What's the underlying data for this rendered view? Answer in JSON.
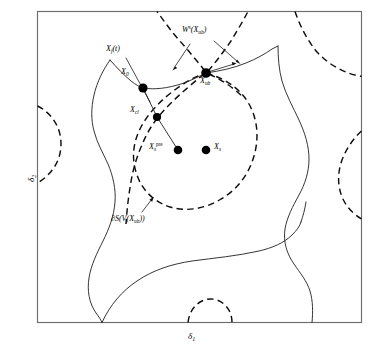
{
  "figure": {
    "kind": "phase-portrait-diagram",
    "caption_present": false,
    "background_color": "#ffffff",
    "frame_color": "#6d6d6d",
    "solid_curve_color": "#2b2b2b",
    "dashed_curve_color": "#0f0f0f",
    "node_color": "#000000"
  },
  "axes": {
    "x_label": "δ₁",
    "x_label_base": "δ",
    "x_label_sub": "1",
    "y_label": "δ₂",
    "y_label_base": "δ",
    "y_label_sub": "2"
  },
  "nodes": [
    {
      "id": "x0",
      "base": "X",
      "sub": "0",
      "sup": "",
      "label": "X₀",
      "x": 143,
      "y": 88,
      "r": 4.6,
      "label_x": 123,
      "label_y": 74
    },
    {
      "id": "xcl",
      "base": "X",
      "sub": "cl",
      "sup": "",
      "label": "Xₑₗ",
      "x": 157,
      "y": 117,
      "r": 4.1,
      "label_x": 132,
      "label_y": 110
    },
    {
      "id": "xspre",
      "base": "X",
      "sub": "s",
      "sup": "pre",
      "label": "Xₛᵖᵣᵉ",
      "x": 178,
      "y": 150,
      "r": 4.3,
      "label_x": 150,
      "label_y": 147
    },
    {
      "id": "xs",
      "base": "X",
      "sub": "s",
      "sup": "",
      "label": "Xₛ",
      "x": 206,
      "y": 150,
      "r": 4.3,
      "label_x": 214,
      "label_y": 146
    },
    {
      "id": "xub",
      "base": "X",
      "sub": "ub",
      "sup": "",
      "label": "Xᵤᵇ",
      "x": 206,
      "y": 73,
      "r": 4.8,
      "label_x": 201,
      "label_y": 80
    }
  ],
  "annotations": [
    {
      "id": "stable-manifold",
      "base": "W",
      "sup": "s",
      "paren_open": "(",
      "inner_base": "X",
      "inner_sub": "ub",
      "paren_close": ")",
      "label": "Wˢ(Xᵤᵇ)",
      "label_x": 183,
      "label_y": 30
    },
    {
      "id": "fault-trajectory",
      "base": "X",
      "sub": "f",
      "paren_open": "(",
      "inner": "t",
      "paren_close": ")",
      "label": "Xf(t)",
      "label_x": 107,
      "label_y": 49
    },
    {
      "id": "stability-boundary",
      "prefix": "∂S(V(",
      "inner_base": "X",
      "inner_sub": "ub",
      "suffix": "))",
      "label": "∂S(V(Xᵤᵇ))",
      "label_x": 112,
      "label_y": 219
    }
  ],
  "legend_note": {
    "solid_meaning": "stability region boundary",
    "dashed_meaning": "level set / stable manifold"
  }
}
